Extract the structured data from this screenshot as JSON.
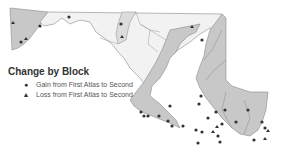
{
  "map": {
    "title": "Change by Block",
    "colors": {
      "highlight_region": "#c8c8c8",
      "base_region": "#f2f2f2",
      "county_border": "#8a8a8a",
      "marker": "#333333"
    },
    "legend": [
      {
        "symbol": "circle",
        "glyph": "●",
        "label": "Gain from First Atlas to Second"
      },
      {
        "symbol": "triangle",
        "glyph": "▲",
        "label": "Loss from First Atlas to Second"
      }
    ]
  }
}
